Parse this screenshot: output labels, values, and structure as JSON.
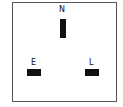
{
  "diagram": {
    "pins": [
      {
        "id": "neutral",
        "label": "N"
      },
      {
        "id": "earth",
        "label": "E"
      },
      {
        "id": "live",
        "label": "L"
      }
    ]
  }
}
